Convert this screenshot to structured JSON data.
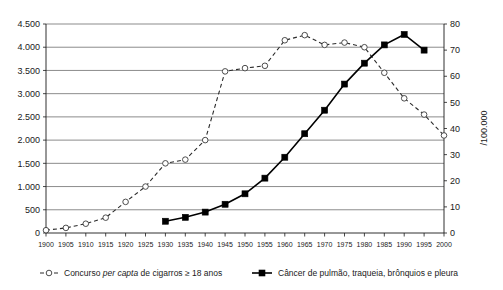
{
  "chart_data": {
    "type": "line",
    "title": "",
    "subtitle": "",
    "xlabel": "",
    "ylabel": "",
    "ylabel_right": "/100.000",
    "grid": true,
    "legend_position": "bottom",
    "x": [
      1900,
      1905,
      1910,
      1915,
      1920,
      1925,
      1930,
      1935,
      1940,
      1945,
      1950,
      1955,
      1960,
      1965,
      1970,
      1975,
      1980,
      1985,
      1990,
      1995,
      2000
    ],
    "x_tick_labels": [
      "1900",
      "1905",
      "1910",
      "1915",
      "1920",
      "1925",
      "1930",
      "1935",
      "1940",
      "1945",
      "1950",
      "1955",
      "1960",
      "1965",
      "1970",
      "1975",
      "1980",
      "1985",
      "1990",
      "1995",
      "2000"
    ],
    "xlim": [
      1900,
      2000
    ],
    "ylim_left": [
      0,
      4500
    ],
    "y_tick_labels_left": [
      "0",
      "500",
      "1.000",
      "1.500",
      "2.000",
      "2.500",
      "3.000",
      "3.500",
      "4.000",
      "4.500"
    ],
    "y_tick_values_left": [
      0,
      500,
      1000,
      1500,
      2000,
      2500,
      3000,
      3500,
      4000,
      4500
    ],
    "ylim_right": [
      0,
      80
    ],
    "y_tick_labels_right": [
      "0",
      "10",
      "20",
      "30",
      "40",
      "50",
      "60",
      "70",
      "80"
    ],
    "y_tick_values_right": [
      0,
      10,
      20,
      30,
      40,
      50,
      60,
      70,
      80
    ],
    "series": [
      {
        "name": "Concurso per capta de cigarros ≥ 18 anos",
        "name_prefix": "Concurso ",
        "name_italic": "per capta",
        "name_suffix": " de cigarros ≥ 18 anos",
        "axis": "left",
        "marker": "open-circle",
        "line_style": "dashed",
        "color": "#2b2b2b",
        "x": [
          1900,
          1905,
          1910,
          1915,
          1920,
          1925,
          1930,
          1935,
          1940,
          1945,
          1950,
          1955,
          1960,
          1965,
          1970,
          1975,
          1980,
          1985,
          1990,
          1995,
          2000
        ],
        "values": [
          60,
          110,
          200,
          330,
          670,
          1000,
          1500,
          1580,
          2000,
          3480,
          3550,
          3600,
          4150,
          4260,
          4050,
          4100,
          4000,
          3450,
          2900,
          2550,
          2100
        ]
      },
      {
        "name": "Câncer de pulmão, traqueia, brônquios e pleura",
        "axis": "right",
        "marker": "filled-square",
        "line_style": "solid",
        "color": "#000000",
        "x": [
          1930,
          1935,
          1940,
          1945,
          1950,
          1955,
          1960,
          1965,
          1970,
          1975,
          1980,
          1985,
          1990,
          1995
        ],
        "values": [
          4.5,
          6,
          8,
          11,
          15,
          21,
          29,
          38,
          47,
          57,
          65,
          72,
          76,
          70
        ]
      }
    ]
  },
  "legend": {
    "items": [
      {
        "marker": "open-circle-dashed",
        "prefix": "Concurso ",
        "italic": "per capta",
        "suffix": " de cigarros ≥ 18 anos"
      },
      {
        "marker": "filled-square-solid",
        "prefix": "",
        "italic": "",
        "suffix": "Câncer de pulmão, traqueia, brônquios e pleura"
      }
    ]
  }
}
